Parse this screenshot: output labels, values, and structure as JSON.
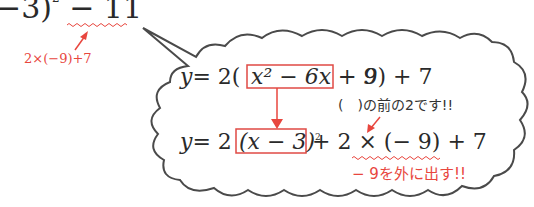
{
  "top_expression": {
    "text_main": "−3)",
    "superscript": "2",
    "tail": "− 11",
    "annotation": "2×(−9)+7"
  },
  "bubble": {
    "line1": {
      "prefix": "y",
      "eq": "= 2(",
      "boxed": "x² − 6x + 9",
      "suffix": "− 9) + 7"
    },
    "note1": "(　)の前の2です!!",
    "line2": {
      "prefix": "y",
      "eq": "= 2",
      "boxed_base": "(x − 3)",
      "boxed_sup": "2",
      "suffix_a": "+ 2 × (− 9) + 7"
    },
    "note2": "− 9を外に出す!!"
  },
  "colors": {
    "accent_red": "#e8463e",
    "outline": "#444444",
    "text": "#2a2a2a"
  }
}
